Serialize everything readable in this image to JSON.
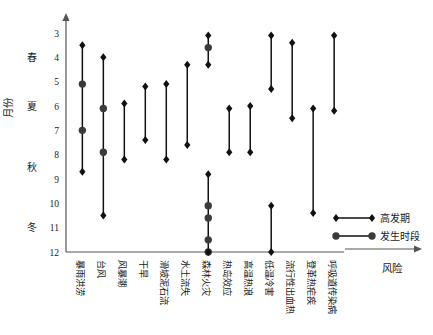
{
  "chart_data": {
    "type": "line",
    "title": "",
    "subtitle": "",
    "xlabel": "风险",
    "ylabel": "月份",
    "ylim": [
      3,
      12
    ],
    "y_inverted": true,
    "yticks": [
      3,
      4,
      5,
      6,
      7,
      8,
      9,
      10,
      11,
      12
    ],
    "ytick_labels": [
      "3",
      "4",
      "5",
      "6",
      "7",
      "8",
      "9",
      "10",
      "11",
      "12"
    ],
    "grid": false,
    "season_bands": [
      {
        "label": "春",
        "month": 4
      },
      {
        "label": "夏",
        "month": 6
      },
      {
        "label": "秋",
        "month": 8.5
      },
      {
        "label": "冬",
        "month": 11
      }
    ],
    "legend_position": "right-bottom",
    "legend": [
      {
        "name": "高发期",
        "marker": "diamond",
        "color": "#111111"
      },
      {
        "name": "发生时段",
        "marker": "circle",
        "color": "#3b3b3b"
      }
    ],
    "categories": [
      "暴雨洪涝",
      "台风",
      "风暴潮",
      "干旱",
      "滑坡泥石流",
      "水土流失",
      "森林火灾",
      "热岛效应",
      "高温热浪",
      "低温冷害",
      "流行性出血热",
      "登革热疟疾",
      "呼吸道传染病"
    ],
    "series": [
      {
        "name": "暴雨洪涝",
        "segments": [
          {
            "start": 3.5,
            "end": 8.7,
            "peaks": [
              5.1,
              7.0
            ]
          }
        ]
      },
      {
        "name": "台风",
        "segments": [
          {
            "start": 4.0,
            "end": 10.5,
            "peaks": [
              6.1,
              7.9
            ]
          }
        ]
      },
      {
        "name": "风暴潮",
        "segments": [
          {
            "start": 5.9,
            "end": 8.2,
            "peaks": []
          }
        ]
      },
      {
        "name": "干旱",
        "segments": [
          {
            "start": 5.2,
            "end": 7.4,
            "peaks": []
          }
        ]
      },
      {
        "name": "滑坡泥石流",
        "segments": [
          {
            "start": 5.1,
            "end": 8.2,
            "peaks": []
          }
        ]
      },
      {
        "name": "水土流失",
        "segments": [
          {
            "start": 4.3,
            "end": 7.6,
            "peaks": []
          }
        ]
      },
      {
        "name": "森林火灾",
        "segments": [
          {
            "start": 3.1,
            "end": 4.3,
            "peaks": [
              3.6
            ]
          },
          {
            "start": 8.8,
            "end": 12.0,
            "peaks": [
              10.1,
              10.6,
              11.5,
              12.0
            ]
          }
        ]
      },
      {
        "name": "热岛效应",
        "segments": [
          {
            "start": 6.1,
            "end": 7.9,
            "peaks": []
          }
        ]
      },
      {
        "name": "高温热浪",
        "segments": [
          {
            "start": 6.0,
            "end": 7.9,
            "peaks": []
          }
        ]
      },
      {
        "name": "低温冷害",
        "segments": [
          {
            "start": 3.1,
            "end": 5.3,
            "peaks": []
          },
          {
            "start": 10.1,
            "end": 12.0,
            "peaks": []
          }
        ]
      },
      {
        "name": "流行性出血热",
        "segments": [
          {
            "start": 3.4,
            "end": 6.5,
            "peaks": []
          }
        ]
      },
      {
        "name": "登革热疟疾",
        "segments": [
          {
            "start": 6.1,
            "end": 10.4,
            "peaks": []
          }
        ]
      },
      {
        "name": "呼吸道传染病",
        "segments": [
          {
            "start": 3.1,
            "end": 6.2,
            "peaks": []
          }
        ]
      }
    ]
  }
}
